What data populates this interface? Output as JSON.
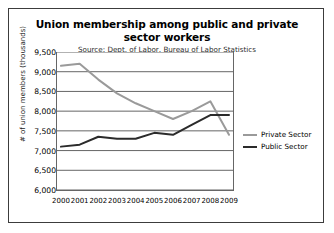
{
  "chart_data": {
    "type": "line",
    "title": "Union membership among public and private sector workers",
    "subtitle": "Source: Dept. of Labor, Bureau of Labor Statistics",
    "xlabel": "",
    "ylabel": "# of union members (thousands)",
    "x": [
      2000,
      2001,
      2002,
      2003,
      2004,
      2005,
      2006,
      2007,
      2008,
      2009
    ],
    "xtick_labels": [
      "2000",
      "2001",
      "2002",
      "2003",
      "2004",
      "2005",
      "2006",
      "2007",
      "2008",
      "2009"
    ],
    "ylim": [
      6000,
      9500
    ],
    "ytick_labels": [
      "9,500",
      "9,000",
      "8,500",
      "8,000",
      "7,500",
      "7,000",
      "6,500",
      "6,000"
    ],
    "ytick_values": [
      9500,
      9000,
      8500,
      8000,
      7500,
      7000,
      6500,
      6000
    ],
    "grid": true,
    "legend_position": "right",
    "series": [
      {
        "name": "Private Sector",
        "color": "#9a9a9a",
        "values": [
          9150,
          9200,
          8800,
          8450,
          8200,
          8000,
          7800,
          8000,
          8250,
          7400
        ]
      },
      {
        "name": "Public Sector",
        "color": "#2b2b2b",
        "values": [
          7100,
          7150,
          7350,
          7300,
          7300,
          7450,
          7400,
          7650,
          7900,
          7900
        ]
      }
    ]
  }
}
